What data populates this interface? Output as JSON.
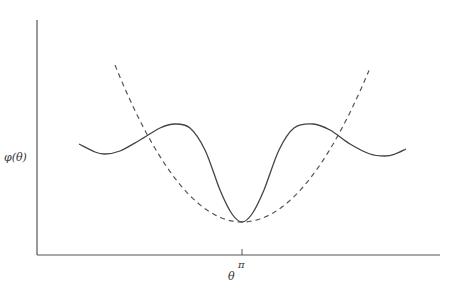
{
  "chart_data": {
    "type": "line",
    "title": "",
    "xlabel": "θ",
    "ylabel": "φ(θ)",
    "x_ticks": [
      {
        "label": "π",
        "position": "center"
      }
    ],
    "y_ticks": [],
    "grid": false,
    "legend": null,
    "series": [
      {
        "name": "φ(θ)",
        "style": "solid",
        "color": "#444444",
        "description": "Oscillating curve with a deep global minimum at π, two local maxima either side, and shallow local minima near the ends",
        "points_px": [
          [
            79,
            144
          ],
          [
            95,
            152
          ],
          [
            105,
            154
          ],
          [
            120,
            151
          ],
          [
            140,
            140
          ],
          [
            160,
            128
          ],
          [
            175,
            124
          ],
          [
            190,
            128
          ],
          [
            205,
            150
          ],
          [
            220,
            190
          ],
          [
            232,
            214
          ],
          [
            242,
            222
          ],
          [
            252,
            214
          ],
          [
            264,
            190
          ],
          [
            279,
            150
          ],
          [
            294,
            128
          ],
          [
            313,
            124
          ],
          [
            330,
            130
          ],
          [
            350,
            144
          ],
          [
            370,
            154
          ],
          [
            385,
            156
          ],
          [
            395,
            154
          ],
          [
            406,
            149
          ]
        ]
      },
      {
        "name": "parabolic approximation",
        "style": "dashed",
        "color": "#555555",
        "description": "Parabola with vertex at π touching the minimum of φ(θ)",
        "vertex_px": [
          242,
          222
        ],
        "points_px": [
          [
            115,
            65
          ],
          [
            242,
            222
          ],
          [
            370,
            68
          ]
        ]
      }
    ],
    "axes_px": {
      "origin": [
        37,
        255
      ],
      "x_end": [
        440,
        255
      ],
      "y_end": [
        37,
        20
      ]
    },
    "tick_px": {
      "x": 242,
      "y": 255
    }
  }
}
